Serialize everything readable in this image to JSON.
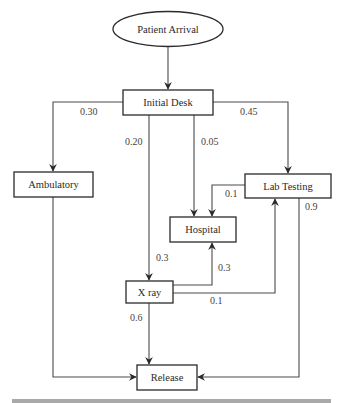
{
  "diagram": {
    "nodes": {
      "start": {
        "label": "Patient Arrival",
        "shape": "ellipse"
      },
      "initial_desk": {
        "label": "Initial Desk"
      },
      "ambulatory": {
        "label": "Ambulatory"
      },
      "hospital": {
        "label": "Hospital"
      },
      "lab_testing": {
        "label": "Lab Testing"
      },
      "xray": {
        "label": "X ray"
      },
      "release": {
        "label": "Release"
      }
    },
    "edges": {
      "arrival_to_desk": {
        "from": "Patient Arrival",
        "to": "Initial Desk",
        "label": ""
      },
      "desk_to_ambulatory": {
        "from": "Initial Desk",
        "to": "Ambulatory",
        "label": "0.30"
      },
      "desk_to_xray": {
        "from": "Initial Desk",
        "to": "X ray",
        "label": "0.20"
      },
      "desk_to_hospital": {
        "from": "Initial Desk",
        "to": "Hospital",
        "label": "0.05"
      },
      "desk_to_lab": {
        "from": "Initial Desk",
        "to": "Lab Testing",
        "label": "0.45"
      },
      "lab_to_hospital": {
        "from": "Lab Testing",
        "to": "Hospital",
        "label": "0.1"
      },
      "lab_to_release": {
        "from": "Lab Testing",
        "to": "Release",
        "label": "0.9"
      },
      "xray_incoming": {
        "label": "0.3"
      },
      "xray_to_hospital": {
        "from": "X ray",
        "to": "Hospital",
        "label": "0.3"
      },
      "xray_to_lab": {
        "from": "X ray",
        "to": "Lab Testing",
        "label": "0.1"
      },
      "xray_to_release": {
        "from": "X ray",
        "to": "Release",
        "label": "0.6"
      },
      "ambulatory_to_release": {
        "from": "Ambulatory",
        "to": "Release",
        "label": ""
      }
    }
  }
}
